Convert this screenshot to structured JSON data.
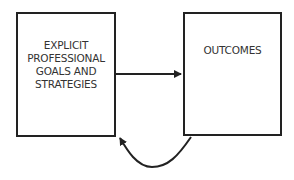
{
  "diagram": {
    "nodes": [
      {
        "id": "left",
        "lines": [
          "EXPLICIT",
          "PROFESSIONAL",
          "GOALS AND",
          "STRATEGIES"
        ]
      },
      {
        "id": "right",
        "lines": [
          "OUTCOMES"
        ]
      }
    ],
    "edges": [
      {
        "from": "left",
        "to": "right",
        "style": "straight"
      },
      {
        "from": "right",
        "to": "left",
        "style": "curved-below"
      }
    ],
    "colors": {
      "stroke": "#222222",
      "text": "#333333",
      "background": "#ffffff"
    }
  }
}
